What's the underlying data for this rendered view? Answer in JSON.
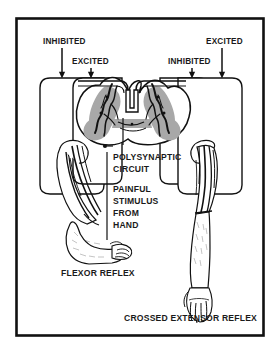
{
  "figure": {
    "title_semantic": "reflex-arc-diagram",
    "border_color": "#111111",
    "background_color": "#ffffff",
    "ink_color": "#111111",
    "gray_matter_color": "#a8a8a8"
  },
  "labels": {
    "top_left_outer": "INHIBITED",
    "top_left_inner": "EXCITED",
    "top_right_inner": "INHIBITED",
    "top_right_outer": "EXCITED",
    "polysynaptic_line1": "POLYSYNAPTIC",
    "polysynaptic_line2": "CIRCUIT",
    "stimulus_line1": "PAINFUL",
    "stimulus_line2": "STIMULUS",
    "stimulus_line3": "FROM",
    "stimulus_line4": "HAND",
    "bottom_left": "FLEXOR REFLEX",
    "bottom_right": "CROSSED EXTENSOR REFLEX"
  },
  "icons": {
    "arrow_down": "arrow-down-icon",
    "leader_dot": "leader-dot-icon",
    "spinal_cord": "spinal-cord-cross-section-icon",
    "flexed_arm": "flexed-arm-icon",
    "extended_arm": "extended-arm-icon"
  }
}
